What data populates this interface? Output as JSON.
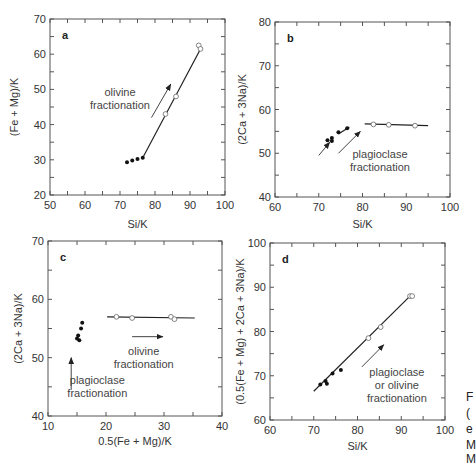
{
  "chart_data": [
    {
      "type": "scatter",
      "panel": "a",
      "xlabel": "Si/K",
      "ylabel": "(Fe + Mg)/K",
      "xlim": [
        50,
        100
      ],
      "ylim": [
        20,
        70
      ],
      "xticks": [
        50,
        60,
        70,
        80,
        90,
        100
      ],
      "yticks": [
        20,
        30,
        40,
        50,
        60,
        70
      ],
      "grid": false,
      "series": [
        {
          "name": "filled",
          "marker": "filled-circle",
          "x": [
            72,
            73.5,
            75,
            76.5
          ],
          "y": [
            29.3,
            29.8,
            30.2,
            30.6
          ]
        },
        {
          "name": "open",
          "marker": "open-circle",
          "x": [
            83,
            86,
            92.5,
            93
          ],
          "y": [
            43,
            48,
            62.5,
            61.5
          ]
        }
      ],
      "lines": [
        {
          "x": [
            76.5,
            93
          ],
          "y": [
            30.6,
            61.5
          ]
        }
      ],
      "arrows": [
        {
          "x": [
            79,
            84.5
          ],
          "y": [
            42,
            51.5
          ]
        }
      ],
      "annotations": [
        {
          "text": [
            "olivine",
            "fractionation"
          ],
          "x": 70,
          "y": 48
        }
      ]
    },
    {
      "type": "scatter",
      "panel": "b",
      "xlabel": "Si/K",
      "ylabel": "(2Ca + 3Na)/K",
      "xlim": [
        60,
        100
      ],
      "ylim": [
        40,
        80
      ],
      "xticks": [
        60,
        70,
        80,
        90,
        100
      ],
      "yticks": [
        40,
        50,
        60,
        70,
        80
      ],
      "grid": false,
      "series": [
        {
          "name": "filled",
          "marker": "filled-circle",
          "x": [
            72,
            73,
            73,
            74.5,
            76.5
          ],
          "y": [
            53,
            53.5,
            52.8,
            54.8,
            55.7
          ]
        },
        {
          "name": "open",
          "marker": "open-circle",
          "x": [
            82.5,
            86,
            92
          ],
          "y": [
            56.6,
            56.5,
            56.3
          ]
        }
      ],
      "lines": [
        {
          "x": [
            80.5,
            95
          ],
          "y": [
            56.7,
            56.3
          ]
        },
        {
          "x": [
            74.5,
            77
          ],
          "y": [
            54.4,
            56
          ]
        }
      ],
      "arrows": [
        {
          "x": [
            70,
            72.5
          ],
          "y": [
            49.5,
            52.5
          ]
        },
        {
          "x": [
            74.5,
            79.5
          ],
          "y": [
            50,
            55
          ]
        }
      ],
      "annotations": [
        {
          "text": [
            "plagioclase",
            "fractionation"
          ],
          "x": 84,
          "y": 49
        }
      ]
    },
    {
      "type": "scatter",
      "panel": "c",
      "xlabel": "0.5(Fe + Mg)/K",
      "ylabel": "(2Ca + 3Na)/K",
      "xlim": [
        10,
        40
      ],
      "ylim": [
        40,
        70
      ],
      "xticks": [
        10,
        20,
        30,
        40
      ],
      "yticks": [
        40,
        50,
        60,
        70
      ],
      "grid": false,
      "series": [
        {
          "name": "filled",
          "marker": "filled-circle",
          "x": [
            15,
            15.2,
            15.4,
            15.7,
            15.9
          ],
          "y": [
            53.3,
            53.8,
            53.0,
            55,
            56
          ]
        },
        {
          "name": "open",
          "marker": "open-circle",
          "x": [
            21.8,
            24.5,
            31.2,
            31.8
          ],
          "y": [
            57,
            56.8,
            57,
            56.6
          ]
        }
      ],
      "lines": [
        {
          "x": [
            20.2,
            35.3
          ],
          "y": [
            57,
            56.8
          ]
        }
      ],
      "arrows": [
        {
          "x": [
            14,
            14
          ],
          "y": [
            44.5,
            50
          ]
        },
        {
          "x": [
            24.5,
            29.8
          ],
          "y": [
            53.6,
            53.6
          ]
        }
      ],
      "annotations": [
        {
          "text": [
            "olivine",
            "fractionation"
          ],
          "x": 26.5,
          "y": 50.5
        },
        {
          "text": [
            "plagioclase",
            "fractionation"
          ],
          "x": 18.5,
          "y": 45.5
        }
      ]
    },
    {
      "type": "scatter",
      "panel": "d",
      "xlabel": "Si/K",
      "ylabel": "(0.5(Fe + Mg) + 2Ca + 3Na)/K",
      "xlim": [
        60,
        100
      ],
      "ylim": [
        60,
        100
      ],
      "xticks": [
        60,
        70,
        80,
        90,
        100
      ],
      "yticks": [
        60,
        70,
        80,
        90,
        100
      ],
      "grid": false,
      "series": [
        {
          "name": "filled",
          "marker": "filled-circle",
          "x": [
            71.5,
            72.7,
            73,
            74.3,
            76.2
          ],
          "y": [
            68,
            68.8,
            68.2,
            70.5,
            71.3
          ]
        },
        {
          "name": "open",
          "marker": "open-circle",
          "x": [
            82.5,
            85.3,
            92,
            92.5
          ],
          "y": [
            78.5,
            81,
            88,
            88
          ]
        }
      ],
      "lines": [
        {
          "x": [
            70,
            92
          ],
          "y": [
            66.5,
            88
          ]
        }
      ],
      "arrows": [
        {
          "x": [
            81,
            86
          ],
          "y": [
            72,
            77
          ]
        }
      ],
      "annotations": [
        {
          "text": [
            "plagioclase",
            "or olivine",
            "fractionation"
          ],
          "x": 89,
          "y": 70
        }
      ]
    }
  ],
  "panels": {
    "a": {
      "label": "a",
      "xlabel": "Si/K",
      "ylabel": "(Fe + Mg)/K"
    },
    "b": {
      "label": "b",
      "xlabel": "Si/K",
      "ylabel": "(2Ca + 3Na)/K"
    },
    "c": {
      "label": "c",
      "xlabel": "0.5(Fe + Mg)/K",
      "ylabel": "(2Ca + 3Na)/K"
    },
    "d": {
      "label": "d",
      "xlabel": "Si/K",
      "ylabel": "(0.5(Fe + Mg) + 2Ca + 3Na)/K"
    }
  },
  "caption_fragments": [
    "F",
    "(",
    "e",
    "M",
    "M"
  ]
}
